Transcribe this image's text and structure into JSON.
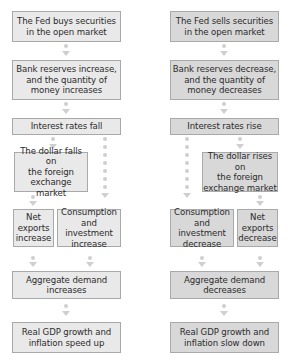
{
  "left_flow": {
    "title": "Fed buys securities (expansionary)",
    "fed_action": "The Fed buys securities\nin the open market",
    "reserves": "Bank reserves increase,\nand the quantity of\nmoney increases",
    "interest": "Interest rates fall",
    "dollar": "The dollar falls on\nthe foreign\nexchange market",
    "net_exports": "Net\nexports\nincrease",
    "consumption": "Consumption\nand investment\nincrease",
    "aggregate_demand": "Aggregate demand\nincreases",
    "outcome": "Real GDP growth and\ninflation speed up"
  },
  "right_flow": {
    "title": "Fed sells securities (contractionary)",
    "fed_action": "The Fed sells securities\nin the open market",
    "reserves": "Bank reserves decrease,\nand the quantity of\nmoney decreases",
    "interest": "Interest rates rise",
    "dollar": "The dollar rises on\nthe foreign\nexchange market",
    "consumption": "Consumption\nand investment\ndecrease",
    "net_exports": "Net\nexports\ndecrease",
    "aggregate_demand": "Aggregate demand\ndecreases",
    "outcome": "Real GDP growth and\ninflation slow down"
  },
  "colors": {
    "left_box_fill": "#e9e9e9",
    "right_box_fill": "#d8d8d8",
    "border": "#a9a9a9",
    "arrow": "#cfcfcf",
    "text": "#2b2b2b"
  }
}
